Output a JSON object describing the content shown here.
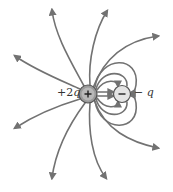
{
  "diagram": {
    "charges": [
      {
        "id": "positive",
        "symbol": "+",
        "label_sign": "+2",
        "label_var": "q",
        "cx": 88,
        "cy": 94,
        "r": 9
      },
      {
        "id": "negative",
        "symbol": "−",
        "label_sign": "−",
        "label_var": "q",
        "cx": 122,
        "cy": 94,
        "r": 8.5
      }
    ],
    "colors": {
      "field_line": "#727272",
      "positive_fill": "#9a9a9a",
      "negative_fill": "#e2e2e2",
      "charge_stroke": "#555555"
    }
  }
}
